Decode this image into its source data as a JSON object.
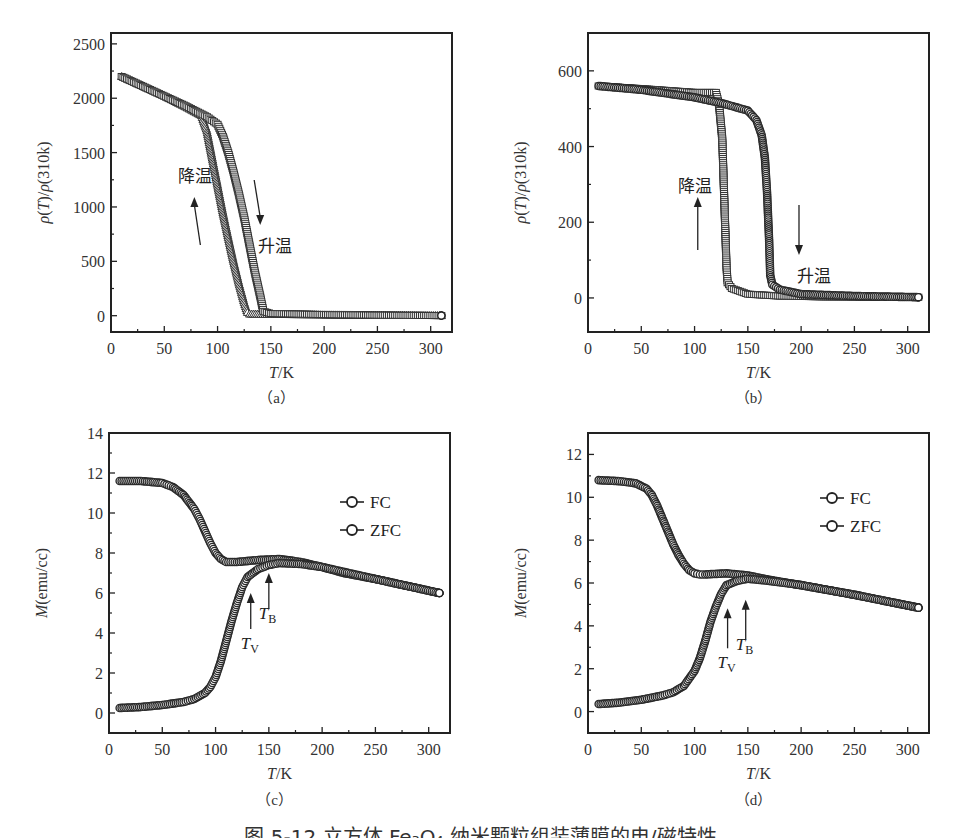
{
  "figure": {
    "caption": "图 5-12 立方体 Fe₃O₄ 纳米颗粒组装薄膜的电/磁特性"
  },
  "chart_data": [
    {
      "id": "a",
      "type": "scatter",
      "panel_label": "（a）",
      "title": "",
      "xlabel": "T/K",
      "ylabel": "ρ(T)/ρ(310k)",
      "xlim": [
        0,
        320
      ],
      "ylim": [
        -150,
        2600
      ],
      "xticks": [
        0,
        50,
        100,
        150,
        200,
        250,
        300
      ],
      "yticks": [
        0,
        500,
        1000,
        1500,
        2000,
        2500
      ],
      "grid": false,
      "annotations": [
        {
          "text": "降温",
          "arrow": "up",
          "x": 82,
          "y": 1200
        },
        {
          "text": "升温",
          "arrow": "down",
          "x": 140,
          "y": 950
        }
      ],
      "series": [
        {
          "name": "降温 (cooling)",
          "marker": "triangle",
          "x": [
            10,
            30,
            50,
            70,
            85,
            90,
            95,
            100,
            105,
            110,
            115,
            120,
            125,
            128,
            130,
            150,
            200,
            250,
            310
          ],
          "y": [
            2200,
            2110,
            2020,
            1920,
            1840,
            1700,
            1450,
            1200,
            950,
            720,
            500,
            300,
            120,
            30,
            15,
            12,
            8,
            5,
            1
          ]
        },
        {
          "name": "升温 (heating)",
          "marker": "square",
          "x": [
            10,
            30,
            50,
            70,
            90,
            100,
            105,
            110,
            115,
            120,
            125,
            130,
            135,
            140,
            143,
            150,
            200,
            250,
            310
          ],
          "y": [
            2200,
            2110,
            2020,
            1930,
            1830,
            1760,
            1650,
            1500,
            1320,
            1120,
            900,
            650,
            400,
            180,
            40,
            20,
            10,
            5,
            1
          ]
        }
      ]
    },
    {
      "id": "b",
      "type": "scatter",
      "panel_label": "（b）",
      "title": "",
      "xlabel": "T/K",
      "ylabel": "ρ(T)/ρ(310k)",
      "xlim": [
        0,
        320
      ],
      "ylim": [
        -90,
        700
      ],
      "xticks": [
        0,
        50,
        100,
        150,
        200,
        250,
        300
      ],
      "yticks": [
        0,
        200,
        400,
        600
      ],
      "grid": false,
      "annotations": [
        {
          "text": "降温",
          "arrow": "up",
          "x": 103,
          "y": 300
        },
        {
          "text": "升温",
          "arrow": "down",
          "x": 198,
          "y": 60
        }
      ],
      "series": [
        {
          "name": "降温 (cooling)",
          "marker": "square",
          "x": [
            10,
            50,
            100,
            120,
            123,
            126,
            128,
            130,
            131,
            135,
            150,
            180,
            220,
            310
          ],
          "y": [
            560,
            553,
            543,
            543,
            510,
            420,
            250,
            80,
            40,
            25,
            10,
            5,
            3,
            2
          ]
        },
        {
          "name": "升温 (heating)",
          "marker": "circle",
          "x": [
            10,
            50,
            100,
            125,
            150,
            158,
            163,
            166,
            168,
            170,
            171,
            173,
            180,
            200,
            250,
            310
          ],
          "y": [
            560,
            550,
            530,
            515,
            495,
            470,
            430,
            370,
            280,
            150,
            60,
            35,
            22,
            10,
            5,
            2
          ]
        }
      ]
    },
    {
      "id": "c",
      "type": "scatter",
      "panel_label": "（c）",
      "title": "",
      "xlabel": "T/K",
      "ylabel": "M(emu/cc)",
      "xlim": [
        0,
        320
      ],
      "ylim": [
        -1,
        14
      ],
      "xticks": [
        0,
        50,
        100,
        150,
        200,
        250,
        300
      ],
      "yticks": [
        0,
        2,
        4,
        6,
        8,
        10,
        12,
        14
      ],
      "grid": false,
      "legend": {
        "position": "upper right",
        "entries": [
          "FC",
          "ZFC"
        ]
      },
      "annotations": [
        {
          "text": "T_V",
          "arrow": "up",
          "x": 133,
          "y": 6.3
        },
        {
          "text": "T_B",
          "arrow": "up",
          "x": 150,
          "y": 7.3
        }
      ],
      "series": [
        {
          "name": "FC",
          "marker": "circle",
          "x": [
            10,
            30,
            50,
            60,
            70,
            80,
            85,
            90,
            95,
            100,
            105,
            110,
            120,
            140,
            160,
            180,
            200,
            220,
            250,
            280,
            310
          ],
          "y": [
            11.6,
            11.6,
            11.5,
            11.3,
            10.9,
            10.2,
            9.7,
            9.1,
            8.5,
            8.0,
            7.7,
            7.55,
            7.55,
            7.65,
            7.7,
            7.55,
            7.3,
            7.0,
            6.7,
            6.35,
            6.0
          ]
        },
        {
          "name": "ZFC",
          "marker": "circle",
          "x": [
            10,
            30,
            50,
            70,
            80,
            90,
            95,
            100,
            105,
            110,
            115,
            120,
            125,
            130,
            140,
            150,
            160,
            180,
            200,
            250,
            310
          ],
          "y": [
            0.25,
            0.3,
            0.4,
            0.55,
            0.7,
            1.0,
            1.3,
            1.8,
            2.6,
            3.6,
            4.6,
            5.5,
            6.3,
            6.8,
            7.2,
            7.4,
            7.5,
            7.45,
            7.3,
            6.7,
            6.0
          ]
        }
      ]
    },
    {
      "id": "d",
      "type": "scatter",
      "panel_label": "（d）",
      "title": "",
      "xlabel": "T/K",
      "ylabel": "M(emu/cc)",
      "xlim": [
        0,
        320
      ],
      "ylim": [
        -1,
        13
      ],
      "xticks": [
        0,
        50,
        100,
        150,
        200,
        250,
        300
      ],
      "yticks": [
        0,
        2,
        4,
        6,
        8,
        10,
        12
      ],
      "grid": false,
      "legend": {
        "position": "upper right",
        "entries": [
          "FC",
          "ZFC"
        ]
      },
      "annotations": [
        {
          "text": "T_V",
          "arrow": "up",
          "x": 131,
          "y": 5.1
        },
        {
          "text": "T_B",
          "arrow": "up",
          "x": 148,
          "y": 5.5
        }
      ],
      "series": [
        {
          "name": "FC",
          "marker": "circle",
          "x": [
            10,
            30,
            45,
            55,
            60,
            65,
            70,
            75,
            80,
            85,
            90,
            95,
            100,
            105,
            110,
            130,
            150,
            170,
            200,
            250,
            310
          ],
          "y": [
            10.8,
            10.75,
            10.65,
            10.4,
            10.1,
            9.6,
            9.0,
            8.4,
            7.8,
            7.3,
            6.9,
            6.6,
            6.45,
            6.4,
            6.4,
            6.45,
            6.35,
            6.15,
            5.9,
            5.45,
            4.85
          ]
        },
        {
          "name": "ZFC",
          "marker": "circle",
          "x": [
            10,
            30,
            50,
            70,
            80,
            90,
            100,
            105,
            110,
            115,
            120,
            125,
            130,
            140,
            150,
            170,
            200,
            250,
            310
          ],
          "y": [
            0.35,
            0.42,
            0.55,
            0.75,
            0.9,
            1.2,
            1.9,
            2.5,
            3.3,
            4.2,
            4.9,
            5.5,
            5.9,
            6.1,
            6.2,
            6.1,
            5.9,
            5.45,
            4.85
          ]
        }
      ]
    }
  ]
}
